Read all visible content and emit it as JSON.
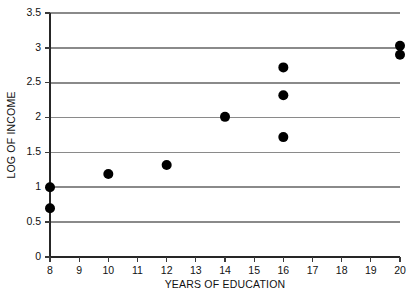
{
  "chart_data": {
    "type": "scatter",
    "title": "",
    "xlabel": "YEARS OF EDUCATION",
    "ylabel": "LOG OF INCOME",
    "xlim": [
      8,
      20
    ],
    "ylim": [
      0,
      3.5
    ],
    "xticks": [
      8,
      9,
      10,
      11,
      12,
      13,
      14,
      15,
      16,
      17,
      18,
      19,
      20
    ],
    "xtick_labels": [
      "8",
      "9",
      "10",
      "11",
      "12",
      "13",
      "14",
      "15",
      "16",
      "17",
      "18",
      "19",
      "20"
    ],
    "yticks": [
      0,
      0.5,
      1,
      1.5,
      2,
      2.5,
      3,
      3.5
    ],
    "ytick_labels": [
      "0",
      "0.5",
      "1",
      "1.5",
      "2",
      "2.5",
      "3",
      "3.5"
    ],
    "grid": "horizontal",
    "gridline_values": [
      0.5,
      1,
      1.5,
      2,
      2.5,
      3,
      3.5
    ],
    "legend": null,
    "marker": "filled-circle",
    "marker_color": "#000000",
    "marker_radius_px": 5,
    "gridline_color": "#8a8a8a",
    "axis_color": "#262626",
    "background_color": "#ffffff",
    "points": [
      {
        "x": 8,
        "y": 1.0
      },
      {
        "x": 8,
        "y": 0.7
      },
      {
        "x": 10,
        "y": 1.19
      },
      {
        "x": 12,
        "y": 1.32
      },
      {
        "x": 14,
        "y": 2.01
      },
      {
        "x": 16,
        "y": 2.72
      },
      {
        "x": 16,
        "y": 2.32
      },
      {
        "x": 16,
        "y": 1.72
      },
      {
        "x": 20,
        "y": 3.03
      },
      {
        "x": 20,
        "y": 2.9
      }
    ]
  }
}
